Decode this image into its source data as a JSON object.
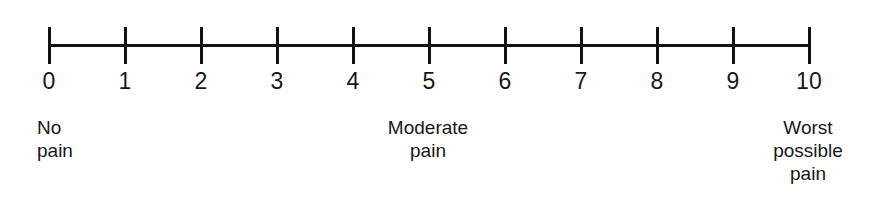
{
  "figure": {
    "name": "numeric-pain-rating-scale",
    "background_color": "#ffffff",
    "ink_color": "#121212"
  },
  "scale": {
    "min": 0,
    "max": 10,
    "tick_count": 11,
    "tick_labels": [
      "0",
      "1",
      "2",
      "3",
      "4",
      "5",
      "6",
      "7",
      "8",
      "9",
      "10"
    ]
  },
  "anchors": {
    "left": {
      "text": "No\npain",
      "line1": "No",
      "line2": "pain",
      "value": "0",
      "align": "left"
    },
    "middle": {
      "text": "Moderate\npain",
      "line1": "Moderate",
      "line2": "pain",
      "value": "5",
      "align": "center"
    },
    "right": {
      "text": "Worst\npossible\npain",
      "line1": "Worst",
      "line2": "possible",
      "line3": "pain",
      "value": "10",
      "align": "center"
    }
  },
  "chart_data": {
    "type": "scale",
    "title": "",
    "xlabel": "",
    "ylabel": "",
    "categories": [
      "0",
      "1",
      "2",
      "3",
      "4",
      "5",
      "6",
      "7",
      "8",
      "9",
      "10"
    ],
    "values": [
      0,
      1,
      2,
      3,
      4,
      5,
      6,
      7,
      8,
      9,
      10
    ],
    "xlim": [
      0,
      10
    ],
    "grid": false,
    "legend": "none",
    "annotations": [
      {
        "at": 0,
        "text": "No pain"
      },
      {
        "at": 5,
        "text": "Moderate pain"
      },
      {
        "at": 10,
        "text": "Worst possible pain"
      }
    ]
  },
  "geometry": {
    "axis_start_x": 48,
    "axis_end_x": 808,
    "axis_y": 44,
    "tick_spacing": 76,
    "tick_top": 27,
    "tick_height": 37
  }
}
